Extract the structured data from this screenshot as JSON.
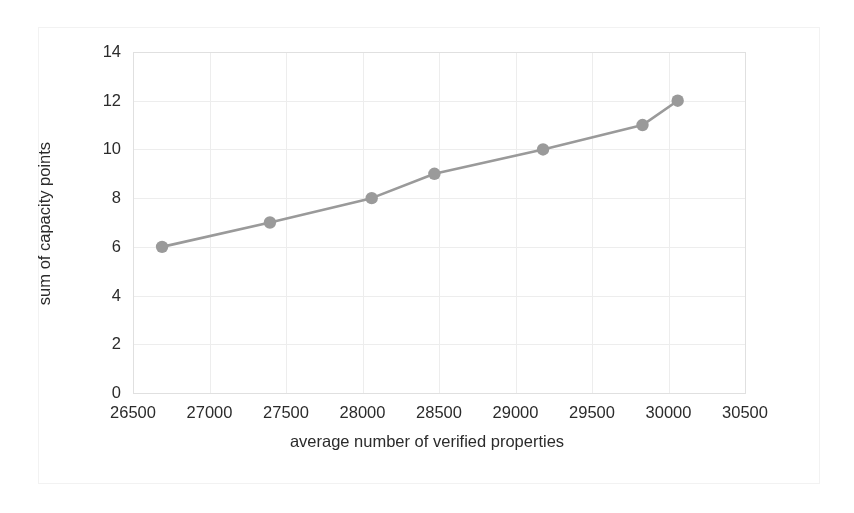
{
  "chart_data": {
    "type": "line",
    "title": "",
    "xlabel": "average number of verified properties",
    "ylabel": "sum of capacity points",
    "xlim": [
      26500,
      30500
    ],
    "ylim": [
      0,
      14
    ],
    "xticks": [
      26500,
      27000,
      27500,
      28000,
      28500,
      29000,
      29500,
      30000,
      30500
    ],
    "yticks": [
      0,
      2,
      4,
      6,
      8,
      10,
      12,
      14
    ],
    "grid": true,
    "legend": false,
    "legend_position": "none",
    "series": [
      {
        "name": "capacity",
        "marker": "circle",
        "color": "#9a9a9a",
        "x": [
          26690,
          27395,
          28060,
          28470,
          29180,
          29830,
          30060
        ],
        "values": [
          6,
          7,
          8,
          9,
          10,
          11,
          12
        ],
        "points": [
          {
            "x": 26690,
            "y": 6
          },
          {
            "x": 27395,
            "y": 7
          },
          {
            "x": 28060,
            "y": 8
          },
          {
            "x": 28470,
            "y": 9
          },
          {
            "x": 29180,
            "y": 10
          },
          {
            "x": 29830,
            "y": 11
          },
          {
            "x": 30060,
            "y": 12
          }
        ]
      }
    ]
  },
  "style": {
    "line_color": "#9a9a9a",
    "marker_color": "#9a9a9a",
    "grid_color": "#ededed",
    "axis_color": "#e0e0e0",
    "text_color": "#2b2b2b",
    "frame_color": "#f2f2f2",
    "background": "#ffffff"
  }
}
